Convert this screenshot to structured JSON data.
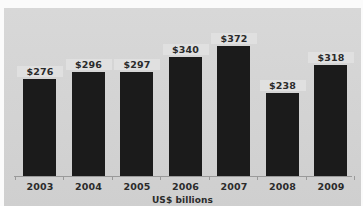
{
  "chart_data": {
    "type": "bar",
    "title": "",
    "subtitle": "",
    "xlabel": "US$ billions",
    "ylabel": "",
    "categories": [
      "2003",
      "2004",
      "2005",
      "2006",
      "2007",
      "2008",
      "2009"
    ],
    "values": [
      276,
      296,
      297,
      340,
      372,
      238,
      318
    ],
    "data_labels": [
      "$276",
      "$296",
      "$297",
      "$340",
      "$372",
      "$238",
      "$318"
    ],
    "ylim": [
      0,
      400
    ],
    "grid": false,
    "legend": false,
    "legend_position": "none",
    "axis_visible": {
      "x": true,
      "y": false
    },
    "series": [
      {
        "name": "US$ billions",
        "values": [
          276,
          296,
          297,
          340,
          372,
          238,
          318
        ]
      }
    ]
  },
  "style": {
    "bar_color": "#1b1b1b",
    "plot_background": "#d4d4d4",
    "page_background": "#ffffff",
    "axis_color": "#9a9a9a",
    "text_color": "#2b2b2b"
  }
}
